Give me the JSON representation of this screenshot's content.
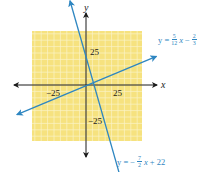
{
  "chart_data": {
    "type": "line",
    "title": "",
    "xlabel": "x",
    "ylabel": "y",
    "xlim": [
      -43,
      43
    ],
    "ylim": [
      -43,
      43
    ],
    "grid": true,
    "grid_step": 5,
    "background_color": "#f6e27f",
    "grid_line_color": "#fbf3c8",
    "line_color": "#2e86c1",
    "axis_color": "#1a1a1a",
    "x_ticks": [
      {
        "value": -25,
        "label": "−25"
      },
      {
        "value": 25,
        "label": "25"
      }
    ],
    "y_ticks": [
      {
        "value": 25,
        "label": "25"
      },
      {
        "value": -25,
        "label": "−25"
      }
    ],
    "series": [
      {
        "name": "y = 5/12 x − 2/3",
        "slope": 0.4167,
        "intercept": -0.6667,
        "x": [
          -54,
          55
        ],
        "y": [
          -23.2,
          22.3
        ],
        "label": {
          "lhs": "y =",
          "frac1_num": "5",
          "frac1_den": "12",
          "var": "x",
          "op": "−",
          "frac2_num": "2",
          "frac2_den": "3"
        }
      },
      {
        "name": "y = −7/2 x + 22",
        "slope": -3.5,
        "intercept": 22,
        "x": [
          -12.5,
          40.5
        ],
        "y": [
          65.8,
          -119.8
        ],
        "label": {
          "lhs": "y =",
          "sign": "−",
          "frac1_num": "7",
          "frac1_den": "2",
          "var": "x",
          "rest": "+ 22"
        }
      }
    ]
  },
  "axes": {
    "x_name": "x",
    "y_name": "y"
  }
}
